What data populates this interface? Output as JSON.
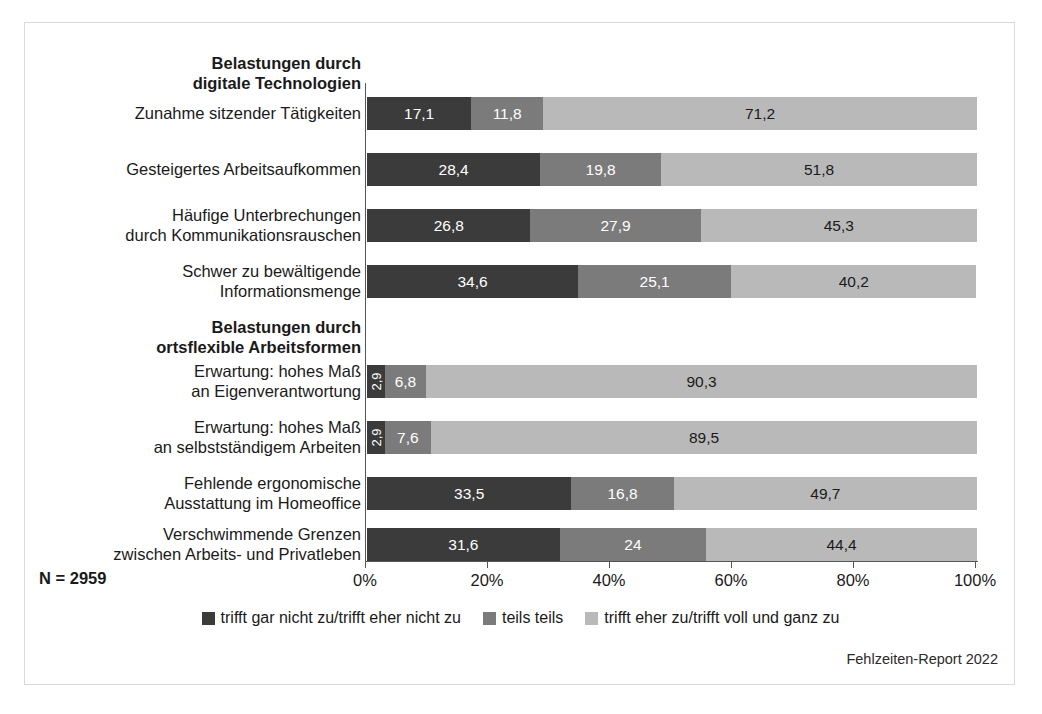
{
  "figure": {
    "n_note": "N = 2959",
    "credit": "Fehlzeiten-Report 2022"
  },
  "legend": {
    "items": [
      {
        "label": "trifft gar nicht zu/trifft eher nicht zu",
        "color": "#3b3b3b"
      },
      {
        "label": "teils teils",
        "color": "#7b7b7b"
      },
      {
        "label": "trifft eher zu/trifft voll und ganz zu",
        "color": "#b9b9b9"
      }
    ]
  },
  "chart_data": {
    "type": "bar",
    "orientation": "horizontal",
    "stacked": true,
    "stack_total": 100,
    "title": "",
    "xlabel": "",
    "ylabel": "",
    "xlim": [
      0,
      100
    ],
    "xticks": [
      0,
      20,
      40,
      60,
      80,
      100
    ],
    "xtick_labels": [
      "0%",
      "20%",
      "40%",
      "60%",
      "80%",
      "100%"
    ],
    "grid": false,
    "legend_position": "bottom-center",
    "series": [
      {
        "name": "trifft gar nicht zu/trifft eher nicht zu",
        "color": "#3b3b3b"
      },
      {
        "name": "teils teils",
        "color": "#7b7b7b"
      },
      {
        "name": "trifft eher zu/trifft voll und ganz zu",
        "color": "#b9b9b9"
      }
    ],
    "groups": [
      {
        "heading": "Belastungen durch\ndigitale Technologien",
        "categories": [
          "Zunahme sitzender Tätigkeiten",
          "Gesteigertes Arbeitsaufkommen",
          "Häufige Unterbrechungen\ndurch Kommunikationsrauschen",
          "Schwer zu bewältigende\nInformationsmenge"
        ],
        "values": [
          [
            17.1,
            11.8,
            71.2
          ],
          [
            28.4,
            19.8,
            51.8
          ],
          [
            26.8,
            27.9,
            45.3
          ],
          [
            34.6,
            25.1,
            40.2
          ]
        ],
        "labels": [
          [
            "17,1",
            "11,8",
            "71,2"
          ],
          [
            "28,4",
            "19,8",
            "51,8"
          ],
          [
            "26,8",
            "27,9",
            "45,3"
          ],
          [
            "34,6",
            "25,1",
            "40,2"
          ]
        ]
      },
      {
        "heading": "Belastungen durch\nortsflexible Arbeitsformen",
        "categories": [
          "Erwartung: hohes Maß\nan Eigenverantwortung",
          "Erwartung: hohes Maß\nan selbstständigem Arbeiten",
          "Fehlende ergonomische\nAusstattung im Homeoffice",
          "Verschwimmende Grenzen\nzwischen Arbeits- und Privatleben"
        ],
        "values": [
          [
            2.9,
            6.8,
            90.3
          ],
          [
            2.9,
            7.6,
            89.5
          ],
          [
            33.5,
            16.8,
            49.7
          ],
          [
            31.6,
            24.0,
            44.4
          ]
        ],
        "labels": [
          [
            "2,9",
            "6,8",
            "90,3"
          ],
          [
            "2,9",
            "7,6",
            "89,5"
          ],
          [
            "33,5",
            "16,8",
            "49,7"
          ],
          [
            "31,6",
            "24",
            "44,4"
          ]
        ]
      }
    ]
  },
  "rows": [
    {
      "kind": "heading",
      "text": "Belastungen durch\ndigitale Technologien",
      "top": 30
    },
    {
      "kind": "bar",
      "text": "Zunahme sitzender Tätigkeiten",
      "top": 74,
      "label_top": 80,
      "segments": [
        {
          "value": 17.1,
          "label": "17,1",
          "cls": "s1",
          "rot": false
        },
        {
          "value": 11.8,
          "label": "11,8",
          "cls": "s2",
          "rot": false
        },
        {
          "value": 71.2,
          "label": "71,2",
          "cls": "s3",
          "rot": false
        }
      ]
    },
    {
      "kind": "bar",
      "text": "Gesteigertes Arbeitsaufkommen",
      "top": 130,
      "label_top": 136,
      "segments": [
        {
          "value": 28.4,
          "label": "28,4",
          "cls": "s1",
          "rot": false
        },
        {
          "value": 19.8,
          "label": "19,8",
          "cls": "s2",
          "rot": false
        },
        {
          "value": 51.8,
          "label": "51,8",
          "cls": "s3",
          "rot": false
        }
      ]
    },
    {
      "kind": "bar",
      "text": "Häufige Unterbrechungen\ndurch Kommunikationsrauschen",
      "top": 186,
      "label_top": 182,
      "segments": [
        {
          "value": 26.8,
          "label": "26,8",
          "cls": "s1",
          "rot": false
        },
        {
          "value": 27.9,
          "label": "27,9",
          "cls": "s2",
          "rot": false
        },
        {
          "value": 45.3,
          "label": "45,3",
          "cls": "s3",
          "rot": false
        }
      ]
    },
    {
      "kind": "bar",
      "text": "Schwer zu bewältigende\nInformationsmenge",
      "top": 242,
      "label_top": 238,
      "segments": [
        {
          "value": 34.6,
          "label": "34,6",
          "cls": "s1",
          "rot": false
        },
        {
          "value": 25.1,
          "label": "25,1",
          "cls": "s2",
          "rot": false
        },
        {
          "value": 40.2,
          "label": "40,2",
          "cls": "s3",
          "rot": false
        }
      ]
    },
    {
      "kind": "heading",
      "text": "Belastungen durch\nortsflexible Arbeitsformen",
      "top": 294
    },
    {
      "kind": "bar",
      "text": "Erwartung: hohes Maß\nan Eigenverantwortung",
      "top": 342,
      "label_top": 338,
      "segments": [
        {
          "value": 2.9,
          "label": "2,9",
          "cls": "s1",
          "rot": true
        },
        {
          "value": 6.8,
          "label": "6,8",
          "cls": "s2",
          "rot": false
        },
        {
          "value": 90.3,
          "label": "90,3",
          "cls": "s3",
          "rot": false
        }
      ]
    },
    {
      "kind": "bar",
      "text": "Erwartung: hohes Maß\nan selbstständigem Arbeiten",
      "top": 398,
      "label_top": 394,
      "segments": [
        {
          "value": 2.9,
          "label": "2,9",
          "cls": "s1",
          "rot": true
        },
        {
          "value": 7.6,
          "label": "7,6",
          "cls": "s2",
          "rot": false
        },
        {
          "value": 89.5,
          "label": "89,5",
          "cls": "s3",
          "rot": false
        }
      ]
    },
    {
      "kind": "bar",
      "text": "Fehlende ergonomische\nAusstattung im Homeoffice",
      "top": 454,
      "label_top": 450,
      "segments": [
        {
          "value": 33.5,
          "label": "33,5",
          "cls": "s1",
          "rot": false
        },
        {
          "value": 16.8,
          "label": "16,8",
          "cls": "s2",
          "rot": false
        },
        {
          "value": 49.7,
          "label": "49,7",
          "cls": "s3",
          "rot": false
        }
      ]
    },
    {
      "kind": "bar",
      "text": "Verschwimmende Grenzen\nzwischen Arbeits- und Privatleben",
      "top": 505,
      "label_top": 501,
      "segments": [
        {
          "value": 31.6,
          "label": "31,6",
          "cls": "s1",
          "rot": false
        },
        {
          "value": 24.0,
          "label": "24",
          "cls": "s2",
          "rot": false
        },
        {
          "value": 44.4,
          "label": "44,4",
          "cls": "s3",
          "rot": false
        }
      ]
    }
  ],
  "axis": {
    "ticks": [
      {
        "label": "0%",
        "pos": 0
      },
      {
        "label": "20%",
        "pos": 20
      },
      {
        "label": "40%",
        "pos": 40
      },
      {
        "label": "60%",
        "pos": 60
      },
      {
        "label": "80%",
        "pos": 80
      },
      {
        "label": "100%",
        "pos": 100
      }
    ]
  }
}
